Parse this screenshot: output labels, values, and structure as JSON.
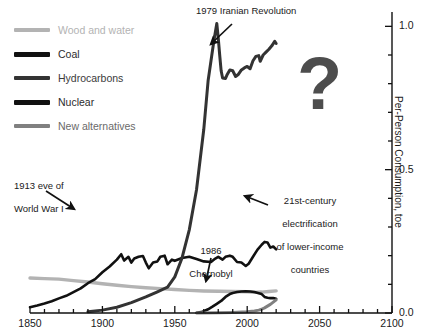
{
  "chart_data": {
    "type": "line",
    "title": "",
    "xlabel": "",
    "ylabel": "Per-Person Consumption, toe",
    "xlim": [
      1850,
      2100
    ],
    "ylim": [
      0.0,
      1.05
    ],
    "xticks": [
      1850,
      1900,
      1950,
      2000,
      2050,
      2100
    ],
    "xticklabels": [
      "1850",
      "1900",
      "1950",
      "2000",
      "2050",
      "2100"
    ],
    "xminor_step": 10,
    "yticks": [
      0.0,
      0.5,
      1.0
    ],
    "yticklabels": [
      "0.0",
      "0.5",
      "1.0"
    ],
    "yminor_step": 0.1,
    "grid": false,
    "legend_position": "upper-left",
    "series": [
      {
        "name": "Wood and water",
        "color": "#b3b3b3",
        "points": [
          [
            1850,
            0.122
          ],
          [
            1860,
            0.12
          ],
          [
            1870,
            0.118
          ],
          [
            1880,
            0.113
          ],
          [
            1890,
            0.108
          ],
          [
            1900,
            0.102
          ],
          [
            1910,
            0.097
          ],
          [
            1920,
            0.092
          ],
          [
            1930,
            0.088
          ],
          [
            1940,
            0.085
          ],
          [
            1950,
            0.082
          ],
          [
            1960,
            0.079
          ],
          [
            1970,
            0.077
          ],
          [
            1980,
            0.076
          ],
          [
            1990,
            0.075
          ],
          [
            2000,
            0.074
          ],
          [
            2005,
            0.072
          ],
          [
            2010,
            0.073
          ],
          [
            2015,
            0.075
          ],
          [
            2020,
            0.077
          ]
        ]
      },
      {
        "name": "Coal",
        "color": "#111111",
        "points": [
          [
            1850,
            0.02
          ],
          [
            1855,
            0.026
          ],
          [
            1860,
            0.033
          ],
          [
            1865,
            0.041
          ],
          [
            1870,
            0.051
          ],
          [
            1875,
            0.06
          ],
          [
            1880,
            0.073
          ],
          [
            1885,
            0.086
          ],
          [
            1890,
            0.104
          ],
          [
            1895,
            0.118
          ],
          [
            1900,
            0.142
          ],
          [
            1905,
            0.162
          ],
          [
            1910,
            0.186
          ],
          [
            1913,
            0.205
          ],
          [
            1915,
            0.183
          ],
          [
            1918,
            0.196
          ],
          [
            1920,
            0.176
          ],
          [
            1922,
            0.19
          ],
          [
            1925,
            0.196
          ],
          [
            1928,
            0.199
          ],
          [
            1930,
            0.176
          ],
          [
            1932,
            0.156
          ],
          [
            1935,
            0.176
          ],
          [
            1938,
            0.18
          ],
          [
            1940,
            0.196
          ],
          [
            1943,
            0.2
          ],
          [
            1945,
            0.17
          ],
          [
            1948,
            0.186
          ],
          [
            1950,
            0.182
          ],
          [
            1955,
            0.192
          ],
          [
            1960,
            0.196
          ],
          [
            1965,
            0.188
          ],
          [
            1970,
            0.18
          ],
          [
            1975,
            0.178
          ],
          [
            1978,
            0.19
          ],
          [
            1980,
            0.196
          ],
          [
            1983,
            0.186
          ],
          [
            1985,
            0.196
          ],
          [
            1988,
            0.2
          ],
          [
            1990,
            0.196
          ],
          [
            1993,
            0.178
          ],
          [
            1996,
            0.176
          ],
          [
            1999,
            0.164
          ],
          [
            2001,
            0.172
          ],
          [
            2004,
            0.196
          ],
          [
            2007,
            0.22
          ],
          [
            2010,
            0.238
          ],
          [
            2012,
            0.248
          ],
          [
            2014,
            0.246
          ],
          [
            2016,
            0.228
          ],
          [
            2018,
            0.232
          ],
          [
            2020,
            0.222
          ]
        ]
      },
      {
        "name": "Hydrocarbons",
        "color": "#333333",
        "points": [
          [
            1890,
            0.004
          ],
          [
            1900,
            0.01
          ],
          [
            1910,
            0.02
          ],
          [
            1920,
            0.036
          ],
          [
            1930,
            0.056
          ],
          [
            1938,
            0.074
          ],
          [
            1945,
            0.09
          ],
          [
            1950,
            0.126
          ],
          [
            1955,
            0.192
          ],
          [
            1960,
            0.29
          ],
          [
            1965,
            0.43
          ],
          [
            1970,
            0.64
          ],
          [
            1973,
            0.81
          ],
          [
            1975,
            0.88
          ],
          [
            1977,
            0.95
          ],
          [
            1979,
            1.01
          ],
          [
            1980,
            0.96
          ],
          [
            1981,
            0.9
          ],
          [
            1982,
            0.845
          ],
          [
            1983,
            0.82
          ],
          [
            1985,
            0.818
          ],
          [
            1986,
            0.83
          ],
          [
            1988,
            0.848
          ],
          [
            1990,
            0.845
          ],
          [
            1992,
            0.825
          ],
          [
            1994,
            0.833
          ],
          [
            1996,
            0.848
          ],
          [
            1998,
            0.855
          ],
          [
            2000,
            0.86
          ],
          [
            2002,
            0.852
          ],
          [
            2004,
            0.88
          ],
          [
            2006,
            0.895
          ],
          [
            2008,
            0.898
          ],
          [
            2009,
            0.878
          ],
          [
            2011,
            0.9
          ],
          [
            2013,
            0.91
          ],
          [
            2015,
            0.92
          ],
          [
            2017,
            0.932
          ],
          [
            2019,
            0.948
          ],
          [
            2020,
            0.94
          ]
        ]
      },
      {
        "name": "Nuclear",
        "color": "#111111",
        "points": [
          [
            1965,
            0.001
          ],
          [
            1968,
            0.003
          ],
          [
            1970,
            0.006
          ],
          [
            1973,
            0.013
          ],
          [
            1976,
            0.022
          ],
          [
            1979,
            0.032
          ],
          [
            1982,
            0.042
          ],
          [
            1985,
            0.056
          ],
          [
            1988,
            0.066
          ],
          [
            1990,
            0.07
          ],
          [
            1993,
            0.073
          ],
          [
            1996,
            0.075
          ],
          [
            1999,
            0.076
          ],
          [
            2002,
            0.075
          ],
          [
            2005,
            0.073
          ],
          [
            2008,
            0.069
          ],
          [
            2010,
            0.066
          ],
          [
            2012,
            0.056
          ],
          [
            2014,
            0.053
          ],
          [
            2016,
            0.052
          ],
          [
            2018,
            0.052
          ],
          [
            2020,
            0.05
          ]
        ]
      },
      {
        "name": "New alternatives",
        "color": "#808080",
        "points": [
          [
            1965,
            0.0
          ],
          [
            1980,
            0.001
          ],
          [
            1990,
            0.002
          ],
          [
            2000,
            0.004
          ],
          [
            2005,
            0.007
          ],
          [
            2008,
            0.01
          ],
          [
            2010,
            0.013
          ],
          [
            2012,
            0.018
          ],
          [
            2014,
            0.024
          ],
          [
            2016,
            0.03
          ],
          [
            2018,
            0.038
          ],
          [
            2020,
            0.046
          ]
        ]
      }
    ],
    "annotations": [
      {
        "id": "iran",
        "text": "1979 Iranian Revolution",
        "arrow_from": [
          232,
          24
        ],
        "arrow_to": [
          211,
          44
        ]
      },
      {
        "id": "ww1",
        "text": "1913 eve of\nWorld War I",
        "arrow_from": [
          46,
          191
        ],
        "arrow_to": [
          74,
          209
        ]
      },
      {
        "id": "chernobyl",
        "text": "1986\nChernobyl",
        "arrow_from": [
          211,
          258
        ],
        "arrow_to": [
          206,
          281
        ]
      },
      {
        "id": "electrification",
        "text": "21st-century\nelectrification\nof lower-income\ncountries",
        "arrow_from": [
          268,
          205
        ],
        "arrow_to": [
          245,
          196
        ]
      }
    ],
    "question_mark": "?"
  },
  "legend": {
    "items": [
      {
        "label": "Wood and water",
        "color": "#b3b3b3"
      },
      {
        "label": "Coal",
        "color": "#111111"
      },
      {
        "label": "Hydrocarbons",
        "color": "#333333"
      },
      {
        "label": "Nuclear",
        "color": "#111111"
      },
      {
        "label": "New alternatives",
        "color": "#808080"
      }
    ]
  },
  "axes": {
    "y_axis_title": "Per-Person Consumption, toe",
    "x_tick_labels": [
      "1850",
      "1900",
      "1950",
      "2000",
      "2050",
      "2100"
    ],
    "y_tick_labels": [
      "0.0",
      "0.5",
      "1.0"
    ]
  },
  "annotations_text": {
    "iran": "1979 Iranian Revolution",
    "ww1_line1": "1913 eve of",
    "ww1_line2": "World War I",
    "chernobyl_line1": "1986",
    "chernobyl_line2": "Chernobyl",
    "elec_line1": "21st-century",
    "elec_line2": "electrification",
    "elec_line3": "of lower-income",
    "elec_line4": "countries",
    "question": "?"
  }
}
